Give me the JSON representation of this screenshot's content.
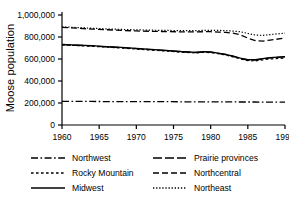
{
  "chart_data": {
    "type": "line",
    "title": "",
    "xlabel": "",
    "ylabel": "Moose population",
    "xlim": [
      1960,
      1990
    ],
    "ylim": [
      0,
      1000000
    ],
    "grid": false,
    "legend_position": "below",
    "xticks": [
      "1960",
      "1965",
      "1970",
      "1975",
      "1980",
      "1985",
      "1990"
    ],
    "xtick_values": [
      1960,
      1965,
      1970,
      1975,
      1980,
      1985,
      1990
    ],
    "yticks": [
      "0",
      "200,000",
      "400,000",
      "600,000",
      "800,000",
      "1,000,000"
    ],
    "ytick_values": [
      0,
      200000,
      400000,
      600000,
      800000,
      1000000
    ],
    "x": [
      1960,
      1962,
      1964,
      1966,
      1968,
      1970,
      1972,
      1974,
      1976,
      1978,
      1979,
      1980,
      1981,
      1982,
      1983,
      1984,
      1985,
      1986,
      1987,
      1988,
      1990
    ],
    "series": [
      {
        "name": "Northwest",
        "style": "dashdot",
        "values": [
          215000,
          214000,
          214000,
          213000,
          213000,
          212000,
          212000,
          212000,
          211000,
          211000,
          211000,
          211000,
          210000,
          210000,
          210000,
          209000,
          209000,
          209000,
          208000,
          208000,
          208000
        ]
      },
      {
        "name": "Rocky Mountain",
        "style": "dotted-short",
        "values": [
          728000,
          722000,
          716000,
          708000,
          700000,
          690000,
          681000,
          672000,
          662000,
          655000,
          660000,
          658000,
          648000,
          637000,
          620000,
          600000,
          585000,
          583000,
          592000,
          600000,
          608000
        ]
      },
      {
        "name": "Midwest",
        "style": "solid",
        "values": [
          733000,
          727000,
          721000,
          713000,
          705000,
          696000,
          687000,
          678000,
          668000,
          661000,
          666000,
          664000,
          654000,
          643000,
          627000,
          607000,
          594000,
          594000,
          604000,
          613000,
          622000
        ]
      },
      {
        "name": "Prairie provinces",
        "style": "longdash",
        "values": [
          731000,
          725000,
          719000,
          711000,
          703000,
          694000,
          685000,
          676000,
          666000,
          659000,
          664000,
          662000,
          652000,
          641000,
          625000,
          605000,
          591000,
          591000,
          601000,
          610000,
          619000
        ]
      },
      {
        "name": "Northcentral",
        "style": "dashed",
        "values": [
          888000,
          880000,
          872000,
          866000,
          860000,
          855000,
          852000,
          849000,
          847000,
          846000,
          848000,
          848000,
          845000,
          842000,
          835000,
          820000,
          790000,
          768000,
          762000,
          772000,
          790000
        ]
      },
      {
        "name": "Northeast",
        "style": "dotted",
        "values": [
          892000,
          886000,
          880000,
          874000,
          869000,
          865000,
          862000,
          860000,
          858000,
          858000,
          860000,
          861000,
          860000,
          858000,
          854000,
          848000,
          832000,
          818000,
          815000,
          822000,
          835000
        ]
      }
    ]
  },
  "legend": {
    "items": [
      {
        "label": "Northwest",
        "style": "dashdot"
      },
      {
        "label": "Prairie provinces",
        "style": "longdash"
      },
      {
        "label": "Rocky Mountain",
        "style": "dotted-short"
      },
      {
        "label": "Northcentral",
        "style": "dashed"
      },
      {
        "label": "Midwest",
        "style": "solid"
      },
      {
        "label": "Northeast",
        "style": "dotted"
      }
    ]
  },
  "colors": {
    "line": "#000000",
    "axis": "#000000",
    "background": "#ffffff"
  }
}
